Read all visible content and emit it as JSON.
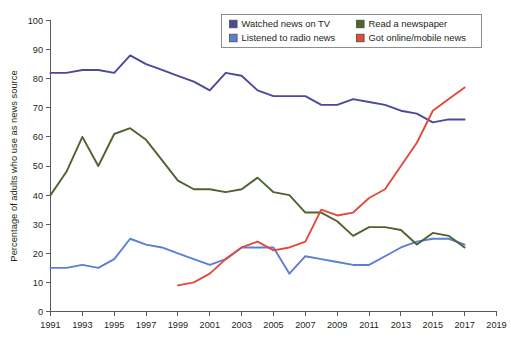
{
  "chart_data": {
    "type": "line",
    "title": "",
    "xlabel": "",
    "ylabel": "Percentage of adults who use as news source",
    "xlim": [
      1991,
      2019
    ],
    "ylim": [
      0,
      100
    ],
    "grid": false,
    "legend_position": "top-right",
    "x_ticks": [
      "1991",
      "1993",
      "1995",
      "1997",
      "1999",
      "2001",
      "2003",
      "2005",
      "2007",
      "2009",
      "2011",
      "2013",
      "2015",
      "2017",
      "2019"
    ],
    "y_ticks": [
      "0",
      "10",
      "20",
      "30",
      "40",
      "50",
      "60",
      "70",
      "80",
      "90",
      "100"
    ],
    "series": [
      {
        "name": "Watched news on TV",
        "color": "#4a4a9c",
        "x": [
          1991,
          1992,
          1993,
          1994,
          1995,
          1996,
          1997,
          1998,
          1999,
          2000,
          2001,
          2002,
          2003,
          2004,
          2005,
          2006,
          2007,
          2008,
          2009,
          2010,
          2011,
          2012,
          2013,
          2014,
          2015,
          2016,
          2017
        ],
        "values": [
          82,
          82,
          83,
          83,
          82,
          88,
          85,
          83,
          81,
          79,
          76,
          82,
          81,
          76,
          74,
          74,
          74,
          71,
          71,
          73,
          72,
          71,
          69,
          68,
          65,
          66,
          66
        ]
      },
      {
        "name": "Listened to radio news",
        "color": "#5b7fd4",
        "x": [
          1991,
          1992,
          1993,
          1994,
          1995,
          1996,
          1997,
          1998,
          1999,
          2000,
          2001,
          2002,
          2003,
          2004,
          2005,
          2006,
          2007,
          2008,
          2009,
          2010,
          2011,
          2012,
          2013,
          2014,
          2015,
          2016,
          2017
        ],
        "values": [
          15,
          15,
          16,
          15,
          18,
          25,
          23,
          22,
          20,
          18,
          16,
          18,
          22,
          22,
          22,
          13,
          19,
          18,
          17,
          16,
          16,
          19,
          22,
          24,
          25,
          25,
          23
        ]
      },
      {
        "name": "Read a newspaper",
        "color": "#4f632f",
        "x": [
          1991,
          1992,
          1993,
          1994,
          1995,
          1996,
          1997,
          1998,
          1999,
          2000,
          2001,
          2002,
          2003,
          2004,
          2005,
          2006,
          2007,
          2008,
          2009,
          2010,
          2011,
          2012,
          2013,
          2014,
          2015,
          2016,
          2017
        ],
        "values": [
          40,
          48,
          60,
          50,
          61,
          63,
          59,
          52,
          45,
          42,
          42,
          41,
          42,
          46,
          41,
          40,
          34,
          34,
          31,
          26,
          29,
          29,
          28,
          23,
          27,
          26,
          22
        ]
      },
      {
        "name": "Got online/mobile news",
        "color": "#e04b3c",
        "x": [
          1999,
          2000,
          2001,
          2002,
          2003,
          2004,
          2005,
          2006,
          2007,
          2008,
          2009,
          2010,
          2011,
          2012,
          2013,
          2014,
          2015,
          2016,
          2017
        ],
        "values": [
          9,
          10,
          13,
          18,
          22,
          24,
          21,
          22,
          24,
          35,
          33,
          34,
          39,
          42,
          50,
          58,
          69,
          73,
          77
        ]
      }
    ],
    "legend": [
      {
        "label": "Watched news on TV",
        "color": "#4a4a9c"
      },
      {
        "label": "Read a newspaper",
        "color": "#4f632f"
      },
      {
        "label": "Listened to radio news",
        "color": "#5b7fd4"
      },
      {
        "label": "Got online/mobile news",
        "color": "#e04b3c"
      }
    ]
  }
}
